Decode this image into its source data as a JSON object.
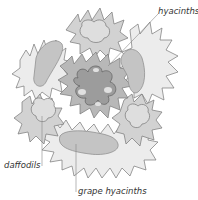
{
  "diagram": {
    "type": "garden-planting-plan",
    "labels": {
      "hyacinths": "hyacinths",
      "daffodils": "daffodils",
      "grape_hyacinths": "grape hyacinths"
    },
    "colors": {
      "outer_ring": "#e8e8e8",
      "mid_ring": "#c8c8c8",
      "center": "#a8a8a8",
      "outline": "#777777",
      "label_text": "#333333",
      "leader_line": "#888888"
    }
  }
}
